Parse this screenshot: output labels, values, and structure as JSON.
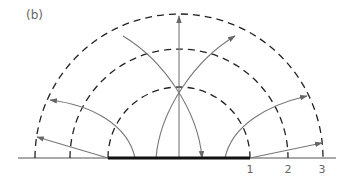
{
  "figure": {
    "label": "(b)",
    "colors": {
      "dashed_circles": "#222222",
      "field_lines": "#777777",
      "plate": "#111111",
      "baseline": "#555555",
      "text": "#666666"
    },
    "center": {
      "x": 179,
      "y": 158
    },
    "plate": {
      "x1": 108,
      "x2": 250
    },
    "circles": [
      {
        "label": "1",
        "radius": 71
      },
      {
        "label": "2",
        "radius": 109
      },
      {
        "label": "3",
        "radius": 144
      }
    ],
    "tick_labels": [
      "1",
      "2",
      "3"
    ]
  }
}
